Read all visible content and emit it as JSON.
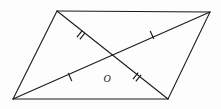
{
  "figure": {
    "kind": "geometry-diagram",
    "shape_name": "parallelogram",
    "width": 221,
    "height": 109,
    "background_color": "#fdfdfd",
    "stroke_color": "#1a1a1a",
    "center_label": "O",
    "vertices": [
      {
        "name": "top-left",
        "x": 57,
        "y": 11
      },
      {
        "name": "top-right",
        "x": 210,
        "y": 12
      },
      {
        "name": "bottom-right",
        "x": 168,
        "y": 99
      },
      {
        "name": "bottom-left",
        "x": 13,
        "y": 99
      }
    ],
    "edges": [
      {
        "name": "top-edge",
        "x1": 57,
        "y1": 11,
        "x2": 210,
        "y2": 12
      },
      {
        "name": "right-edge",
        "x1": 210,
        "y1": 12,
        "x2": 168,
        "y2": 99
      },
      {
        "name": "bottom-edge",
        "x1": 168,
        "y1": 99,
        "x2": 13,
        "y2": 99
      },
      {
        "name": "left-edge",
        "x1": 13,
        "y1": 99,
        "x2": 57,
        "y2": 11
      }
    ],
    "diagonals": [
      {
        "name": "diagonal-topleft-bottomright",
        "x1": 57,
        "y1": 11,
        "x2": 168,
        "y2": 99,
        "ticks": 2
      },
      {
        "name": "diagonal-bottomleft-topright",
        "x1": 13,
        "y1": 99,
        "x2": 210,
        "y2": 12,
        "ticks": 1
      }
    ],
    "intersection": {
      "name": "O",
      "x": 111,
      "y": 55
    },
    "tick_marks": [
      {
        "name": "tick-double-upper-left",
        "x": 81,
        "y": 35,
        "count": 2,
        "angle_deg": 38.4
      },
      {
        "name": "tick-double-lower-right",
        "x": 137,
        "y": 77,
        "count": 2,
        "angle_deg": 38.4
      },
      {
        "name": "tick-single-lower-left",
        "x": 70,
        "y": 77,
        "count": 1,
        "angle_deg": -23.8
      },
      {
        "name": "tick-single-upper-right",
        "x": 152,
        "y": 35,
        "count": 1,
        "angle_deg": -23.8
      }
    ],
    "label_position": {
      "x": 107,
      "y": 82
    }
  }
}
